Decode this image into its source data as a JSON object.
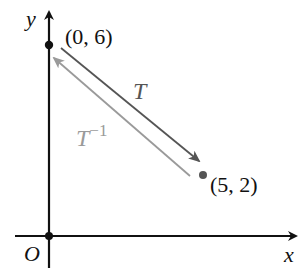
{
  "diagram": {
    "axes": {
      "x_label": "x",
      "y_label": "y",
      "origin_label": "O"
    },
    "points": [
      {
        "id": "p1",
        "label": "(0, 6)",
        "coords": [
          0,
          6
        ],
        "color": "#111111"
      },
      {
        "id": "p2",
        "label": "(5, 2)",
        "coords": [
          5,
          2
        ],
        "color": "#555555"
      }
    ],
    "transformations": [
      {
        "id": "T",
        "label": "T",
        "from": "(0, 6)",
        "to": "(5, 2)",
        "color": "#555555"
      },
      {
        "id": "T_inverse",
        "label_base": "T",
        "label_superscript": "−1",
        "from": "(5, 2)",
        "to": "(0, 6)",
        "color": "#9a9a9a"
      }
    ],
    "colors": {
      "axis": "#111111",
      "T_arrow": "#555555",
      "T_inverse_arrow": "#9a9a9a",
      "background": "#ffffff"
    }
  }
}
